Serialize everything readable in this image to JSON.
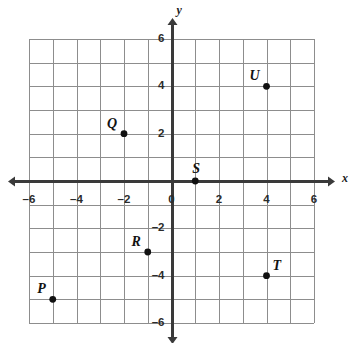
{
  "chart_data": {
    "type": "scatter",
    "title": "",
    "subtitle": "",
    "xlabel": "x",
    "ylabel": "y",
    "xlim": [
      -6,
      6
    ],
    "ylim": [
      -6,
      6
    ],
    "grid": true,
    "grid_step": 1,
    "tick_step": 2,
    "legend": "none",
    "x_tick_labels": [
      "–6",
      "–4",
      "–2",
      "0",
      "2",
      "4",
      "6"
    ],
    "x_tick_values": [
      -6,
      -4,
      -2,
      0,
      2,
      4,
      6
    ],
    "y_tick_labels": [
      "–6",
      "–4",
      "–2",
      "2",
      "4",
      "6"
    ],
    "y_tick_values": [
      -6,
      -4,
      -2,
      2,
      4,
      6
    ],
    "points": [
      {
        "label": "P",
        "x": -5,
        "y": -5,
        "label_pos": "upper-left"
      },
      {
        "label": "Q",
        "x": -2,
        "y": 2,
        "label_pos": "upper-left"
      },
      {
        "label": "R",
        "x": -1,
        "y": -3,
        "label_pos": "upper-left"
      },
      {
        "label": "S",
        "x": 1,
        "y": 0,
        "label_pos": "above"
      },
      {
        "label": "T",
        "x": 4,
        "y": -4,
        "label_pos": "upper-right"
      },
      {
        "label": "U",
        "x": 4,
        "y": 4,
        "label_pos": "upper-left"
      }
    ],
    "colors": {
      "background": "#ffffff",
      "grid": "#8d8d8d",
      "axis": "#3a3a3a",
      "point": "#111111",
      "text": "#121212"
    }
  }
}
